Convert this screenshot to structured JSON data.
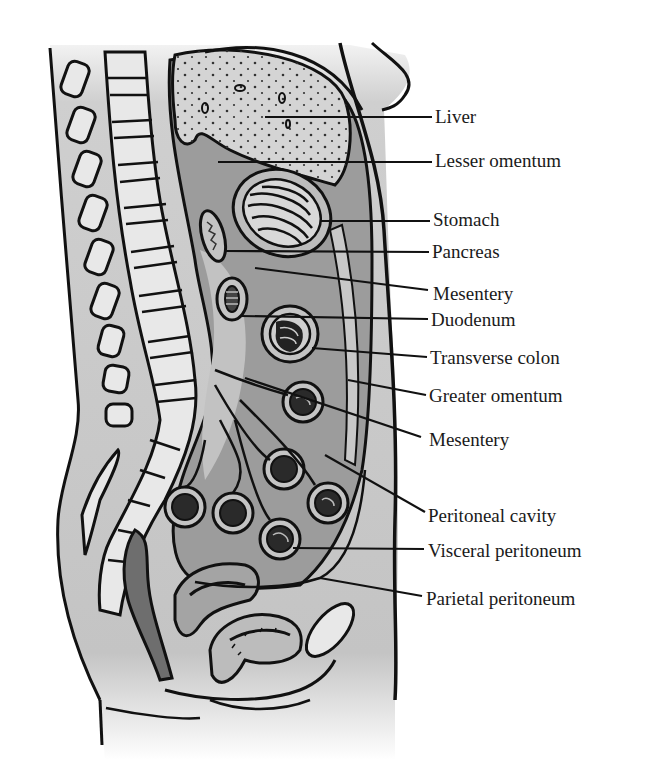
{
  "diagram": {
    "type": "anatomical sagittal section",
    "colors": {
      "background": "#ffffff",
      "body_fill": "#c8c8c8",
      "organ_light": "#d6d6d6",
      "peritoneal_cavity": "#9a9a9a",
      "mesentery_dark": "#7c7c7c",
      "outline": "#111111",
      "bone_fill": "#e6e6e6"
    }
  },
  "labels": [
    {
      "id": "liver",
      "text": "Liver",
      "x": 435,
      "y": 107,
      "target": [
        265,
        117
      ]
    },
    {
      "id": "lesser-omentum",
      "text": "Lesser omentum",
      "x": 435,
      "y": 150,
      "target": [
        218,
        162
      ]
    },
    {
      "id": "stomach",
      "text": "Stomach",
      "x": 433,
      "y": 208,
      "target": [
        320,
        221
      ]
    },
    {
      "id": "pancreas",
      "text": "Pancreas",
      "x": 432,
      "y": 242,
      "target": [
        225,
        251
      ]
    },
    {
      "id": "mesentery-upper",
      "text": "Mesentery",
      "x": 433,
      "y": 284,
      "target": [
        255,
        268
      ]
    },
    {
      "id": "duodenum",
      "text": "Duodenum",
      "x": 431,
      "y": 311,
      "target": [
        240,
        316
      ]
    },
    {
      "id": "transverse-colon",
      "text": "Transverse colon",
      "x": 430,
      "y": 349,
      "target": [
        312,
        348
      ]
    },
    {
      "id": "greater-omentum",
      "text": "Greater omentum",
      "x": 429,
      "y": 386,
      "target": [
        348,
        380
      ]
    },
    {
      "id": "mesentery-lower",
      "text": "Mesentery",
      "x": 429,
      "y": 430,
      "target": [
        245,
        378
      ]
    },
    {
      "id": "peritoneal-cavity",
      "text": "Peritoneal cavity",
      "x": 428,
      "y": 506,
      "target": [
        325,
        455
      ]
    },
    {
      "id": "visceral-peritoneum",
      "text": "Visceral peritoneum",
      "x": 428,
      "y": 542,
      "target": [
        293,
        548
      ]
    },
    {
      "id": "parietal-peritoneum",
      "text": "Parietal peritoneum",
      "x": 426,
      "y": 590,
      "target": [
        320,
        578
      ]
    }
  ]
}
